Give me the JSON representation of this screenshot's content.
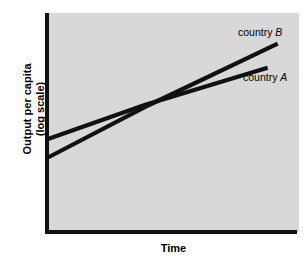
{
  "chart_data": {
    "type": "line",
    "title": "",
    "subtitle": "",
    "xlabel": "Time",
    "ylabel": "Output per capita",
    "ylabel_line2": "(log scale)",
    "ylabel_full": "Output per capita (log scale)",
    "xlim": [
      0,
      100
    ],
    "ylim": [
      0,
      100
    ],
    "grid": false,
    "xticks": [],
    "yticks": [],
    "xticklabels": [],
    "yticklabels": [],
    "legend_position": "inline-right-annotations",
    "panel_background": "#d8d8d8",
    "line_color": "#111111",
    "series": [
      {
        "name": "country A",
        "label_prefix": "country",
        "label_symbol": "A",
        "x": [
          0,
          44,
          100
        ],
        "values": [
          42.5,
          58,
          75
        ],
        "description": "flatter line, lower start, lower finish"
      },
      {
        "name": "country B",
        "label_prefix": "country",
        "label_symbol": "B",
        "x": [
          0,
          44,
          100
        ],
        "values": [
          34,
          58,
          86
        ],
        "description": "steeper line, lower start, crosses country A mid-chart, higher finish"
      }
    ],
    "annotations": [
      {
        "text": "country B",
        "prefix": "country",
        "symbol": "B"
      },
      {
        "text": "country A",
        "prefix": "country",
        "symbol": "A"
      }
    ]
  },
  "axes": {
    "x_title": "Time",
    "y_title_line1": "Output per capita",
    "y_title_line2": "(log scale)"
  },
  "labels": {
    "country_b": {
      "prefix": "country",
      "symbol": "B"
    },
    "country_a": {
      "prefix": "country",
      "symbol": "A"
    }
  },
  "colors": {
    "panel": "#d8d8d8",
    "axis": "#111111",
    "line": "#111111",
    "page": "#ffffff",
    "text": "#000000"
  }
}
